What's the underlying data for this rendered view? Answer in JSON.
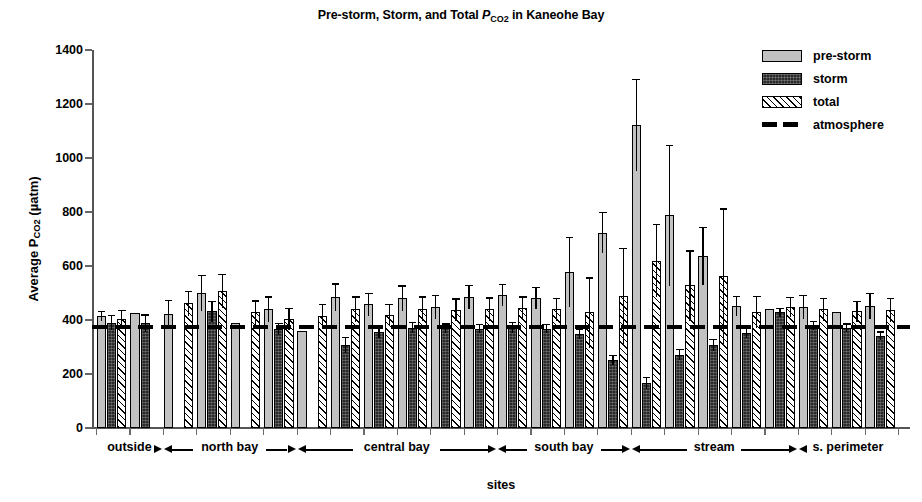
{
  "chart_data": {
    "type": "bar",
    "title": "Pre-storm, Storm, and Total PCO2 in Kaneohe Bay",
    "title_parts": {
      "before": "Pre-storm, Storm, and Total ",
      "italic_p": "P",
      "subscript": "CO",
      "subscript_num": "2",
      "after": " in Kaneohe Bay"
    },
    "xlabel": "sites",
    "ylabel": "Average PCO2 (µatm)",
    "ylabel_parts": {
      "before": "Average ",
      "italic_p": "P",
      "subscript": "CO",
      "subscript_num": "2",
      "after": " (µatm)"
    },
    "ylim": [
      0,
      1400
    ],
    "yticks": [
      0,
      200,
      400,
      600,
      800,
      1000,
      1200,
      1400
    ],
    "ytick_labels": [
      "0",
      "200",
      "400",
      "600",
      "800",
      "1000",
      "1200",
      "1400"
    ],
    "grid": false,
    "legend_position": "top-right",
    "reference_line": {
      "label": "atmosphere",
      "value": 375,
      "style": "dashed"
    },
    "series": [
      {
        "name": "pre-storm",
        "fill": "light-gray-solid",
        "color": "#c2c2c2"
      },
      {
        "name": "storm",
        "fill": "dark-textured",
        "color": "#2a2a2a"
      },
      {
        "name": "total",
        "fill": "diagonal-hatch",
        "color": "#ffffff"
      }
    ],
    "groups": [
      {
        "label": "outside",
        "n_sites": 2
      },
      {
        "label": "north bay",
        "n_sites": 4
      },
      {
        "label": "central bay",
        "n_sites": 6
      },
      {
        "label": "south bay",
        "n_sites": 4
      },
      {
        "label": "stream",
        "n_sites": 5
      },
      {
        "label": "s. perimeter",
        "n_sites": 3
      }
    ],
    "sites": [
      {
        "group": "outside",
        "pre_storm": 415,
        "pre_storm_err": 18,
        "storm": 390,
        "storm_err": 28,
        "total": 402,
        "total_err": 35
      },
      {
        "group": "outside",
        "pre_storm": 425,
        "pre_storm_err": 0,
        "storm": 388,
        "storm_err": 33,
        "total": null,
        "total_err": null
      },
      {
        "group": "north bay",
        "pre_storm": 422,
        "pre_storm_err": 52,
        "storm": null,
        "storm_err": null,
        "total": 462,
        "total_err": 46
      },
      {
        "group": "north bay",
        "pre_storm": 500,
        "pre_storm_err": 68,
        "storm": 432,
        "storm_err": 38,
        "total": 508,
        "total_err": 62
      },
      {
        "group": "north bay",
        "pre_storm": 388,
        "pre_storm_err": 0,
        "storm": null,
        "storm_err": null,
        "total": 428,
        "total_err": 45
      },
      {
        "group": "north bay",
        "pre_storm": 440,
        "pre_storm_err": 48,
        "storm": 368,
        "storm_err": 22,
        "total": 404,
        "total_err": 40
      },
      {
        "group": "central bay",
        "pre_storm": 360,
        "pre_storm_err": 0,
        "storm": null,
        "storm_err": null,
        "total": 415,
        "total_err": 45
      },
      {
        "group": "central bay",
        "pre_storm": 484,
        "pre_storm_err": 52,
        "storm": 308,
        "storm_err": 30,
        "total": 440,
        "total_err": 48
      },
      {
        "group": "central bay",
        "pre_storm": 458,
        "pre_storm_err": 42,
        "storm": 355,
        "storm_err": 22,
        "total": 420,
        "total_err": 40
      },
      {
        "group": "central bay",
        "pre_storm": 480,
        "pre_storm_err": 48,
        "storm": 372,
        "storm_err": 20,
        "total": 442,
        "total_err": 46
      },
      {
        "group": "central bay",
        "pre_storm": 448,
        "pre_storm_err": 44,
        "storm": 370,
        "storm_err": 18,
        "total": 438,
        "total_err": 42
      },
      {
        "group": "central bay",
        "pre_storm": 486,
        "pre_storm_err": 44,
        "storm": 368,
        "storm_err": 18,
        "total": 440,
        "total_err": 44
      },
      {
        "group": "south bay",
        "pre_storm": 492,
        "pre_storm_err": 42,
        "storm": 372,
        "storm_err": 20,
        "total": 444,
        "total_err": 44
      },
      {
        "group": "south bay",
        "pre_storm": 482,
        "pre_storm_err": 40,
        "storm": 368,
        "storm_err": 18,
        "total": 440,
        "total_err": 42
      },
      {
        "group": "south bay",
        "pre_storm": 578,
        "pre_storm_err": 130,
        "storm": 348,
        "storm_err": 18,
        "total": 428,
        "total_err": 130
      },
      {
        "group": "south bay",
        "pre_storm": 724,
        "pre_storm_err": 76,
        "storm": 252,
        "storm_err": 20,
        "total": 490,
        "total_err": 178
      },
      {
        "group": "stream",
        "pre_storm": 1122,
        "pre_storm_err": 172,
        "storm": 168,
        "storm_err": 22,
        "total": 620,
        "total_err": 135
      },
      {
        "group": "stream",
        "pre_storm": 788,
        "pre_storm_err": 262,
        "storm": 272,
        "storm_err": 22,
        "total": 528,
        "total_err": 130
      },
      {
        "group": "stream",
        "pre_storm": 638,
        "pre_storm_err": 108,
        "storm": 308,
        "storm_err": 22,
        "total": 562,
        "total_err": 252
      },
      {
        "group": "stream",
        "pre_storm": 452,
        "pre_storm_err": 38,
        "storm": 352,
        "storm_err": 18,
        "total": 430,
        "total_err": 60
      },
      {
        "group": "stream",
        "pre_storm": 440,
        "pre_storm_err": 0,
        "storm": 428,
        "storm_err": 16,
        "total": 448,
        "total_err": 38
      },
      {
        "group": "s. perimeter",
        "pre_storm": 448,
        "pre_storm_err": 44,
        "storm": 380,
        "storm_err": 18,
        "total": 440,
        "total_err": 42
      },
      {
        "group": "s. perimeter",
        "pre_storm": 428,
        "pre_storm_err": 0,
        "storm": 372,
        "storm_err": 16,
        "total": 432,
        "total_err": 40
      },
      {
        "group": "s. perimeter",
        "pre_storm": 452,
        "pre_storm_err": 48,
        "storm": 342,
        "storm_err": 16,
        "total": 438,
        "total_err": 44
      }
    ]
  },
  "legend": {
    "items": [
      {
        "label": "pre-storm",
        "kind": "pre-storm"
      },
      {
        "label": "storm",
        "kind": "storm"
      },
      {
        "label": "total",
        "kind": "total"
      },
      {
        "label": "atmosphere",
        "kind": "atmosphere"
      }
    ]
  }
}
